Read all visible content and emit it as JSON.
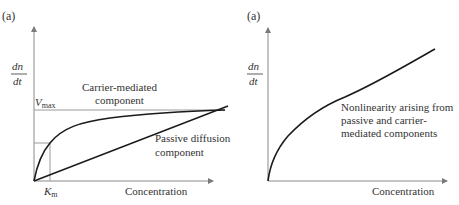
{
  "left_panel": {
    "panel_label": "(a)",
    "y_label_num": "dn",
    "y_label_den": "dt",
    "x_label": "Concentration",
    "vmax_label": "V",
    "vmax_sub": "max",
    "km_label": "K",
    "km_sub": "m",
    "carrier_label_line1": "Carrier-mediated",
    "carrier_label_line2": "component",
    "passive_label_line1": "Passive diffusion",
    "passive_label_line2": "component"
  },
  "right_panel": {
    "panel_label": "(a)",
    "y_label_num": "dn",
    "y_label_den": "dt",
    "x_label": "Concentration",
    "annotation_line1": "Nonlinearity arising from",
    "annotation_line2": "passive and carrier-",
    "annotation_line3": "mediated components"
  },
  "colors": {
    "axis": "#8a8a8a",
    "curve": "#1a1a1a",
    "guide": "#9a9a9a"
  }
}
